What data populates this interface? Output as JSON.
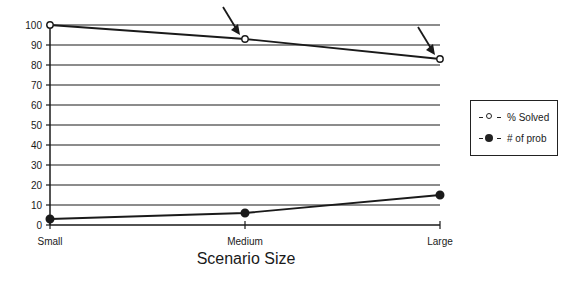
{
  "chart_data": {
    "type": "line",
    "title": "",
    "xlabel": "Scenario Size",
    "ylabel": "",
    "categories": [
      "Small",
      "Medium",
      "Large"
    ],
    "series": [
      {
        "name": "% Solved",
        "marker": "open-circle",
        "values": [
          100,
          93,
          83
        ]
      },
      {
        "name": "# of prob",
        "marker": "filled-circle",
        "values": [
          3,
          6,
          15
        ]
      }
    ],
    "ylim": [
      0,
      100
    ],
    "yticks": [
      0,
      10,
      20,
      30,
      40,
      50,
      60,
      70,
      80,
      90,
      100
    ],
    "grid": true,
    "legend_position": "right",
    "annotations": [
      {
        "type": "arrow",
        "points_to": {
          "series": "% Solved",
          "category": "Medium"
        }
      },
      {
        "type": "arrow",
        "points_to": {
          "series": "% Solved",
          "category": "Large"
        }
      }
    ]
  },
  "legend": {
    "items": [
      {
        "label": "% Solved",
        "marker": "open-circle"
      },
      {
        "label": "# of prob",
        "marker": "filled-circle"
      }
    ]
  },
  "colors": {
    "ink": "#1a1a1a",
    "background": "#ffffff"
  }
}
